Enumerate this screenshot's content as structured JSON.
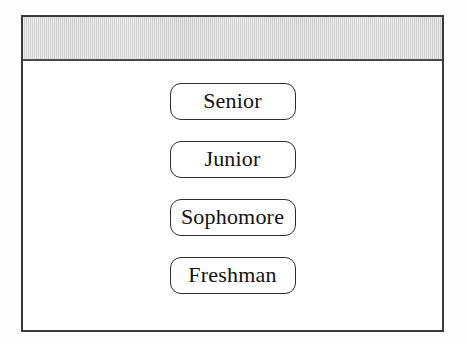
{
  "window": {
    "title_bar": {
      "label": "",
      "background_color": "#d8d8d8",
      "border_color": "#3a3a3a"
    },
    "frame": {
      "border_color": "#3a3a3a",
      "background_color": "#ffffff"
    }
  },
  "content": {
    "buttons": [
      {
        "label": "Senior"
      },
      {
        "label": "Junior"
      },
      {
        "label": "Sophomore"
      },
      {
        "label": "Freshman"
      }
    ]
  }
}
